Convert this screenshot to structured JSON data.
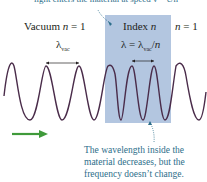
{
  "top_caption": "light enters the material at speed v = c/n",
  "regions": {
    "left": {
      "label": "Vacuum n = 1",
      "wavelength": "λvac"
    },
    "middle": {
      "label": "Index n",
      "wavelength": "λ = λvac/n"
    },
    "right": {
      "label": "n = 1"
    }
  },
  "note": [
    "The wavelength inside the",
    "material decreases, but the",
    "frequency doesn’t change."
  ],
  "colors": {
    "medium": "#b3c6e0",
    "wave": "#4a2c4a",
    "arrow": "#3f9a3a",
    "annotation": "#2c6e8a"
  }
}
